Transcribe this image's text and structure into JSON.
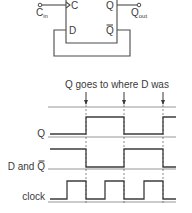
{
  "circuit": {
    "clock_pin_label": "C",
    "data_pin_label": "D",
    "q_pin_label": "Q",
    "qbar_pin_label": "Q",
    "clock_input_label": "C",
    "clock_input_sub": "in",
    "output_label": "Q",
    "output_sub": "out"
  },
  "timing": {
    "annotation": "Q goes to where D was",
    "signals": [
      {
        "name": "Q",
        "label": "Q",
        "overbar": false
      },
      {
        "name": "D and Q-bar",
        "label": "D and Q",
        "overbar_last_char": true
      },
      {
        "name": "clock",
        "label": "clock",
        "overbar": false
      }
    ],
    "edge_markers_x": [
      86,
      124,
      163
    ],
    "clock_edges_x": [
      67,
      86,
      105,
      124,
      144,
      163
    ],
    "waveforms": {
      "Q": {
        "y_high": 117,
        "y_low": 134,
        "ref_y": 137,
        "segments": [
          [
            "low",
            50,
            86
          ],
          [
            "high",
            86,
            124
          ],
          [
            "low",
            124,
            163
          ],
          [
            "high",
            163,
            176
          ]
        ]
      },
      "D_and_Qbar": {
        "y_high": 149,
        "y_low": 167,
        "ref_y": 169,
        "segments": [
          [
            "high",
            50,
            86
          ],
          [
            "low",
            86,
            124
          ],
          [
            "high",
            124,
            163
          ],
          [
            "low",
            163,
            176
          ]
        ]
      },
      "clock": {
        "y_high": 181,
        "y_low": 199,
        "ref_y": 202,
        "segments": [
          [
            "low",
            50,
            67
          ],
          [
            "high",
            67,
            86
          ],
          [
            "low",
            86,
            105
          ],
          [
            "high",
            105,
            124
          ],
          [
            "low",
            124,
            144
          ],
          [
            "high",
            144,
            163
          ],
          [
            "low",
            163,
            176
          ]
        ]
      }
    },
    "top_ref_y": 107
  }
}
